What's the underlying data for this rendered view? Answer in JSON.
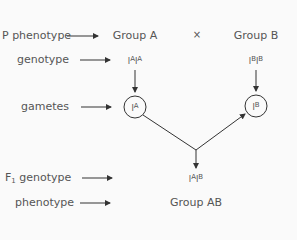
{
  "row_labels": {
    "p_phenotype": "P phenotype",
    "genotype": "genotype",
    "gametes": "gametes",
    "f1_prefix": "F",
    "f1_sub": "1",
    "f1_genotype": " genotype",
    "phenotype": "phenotype"
  },
  "parents": {
    "a": {
      "phenotype": "Group A",
      "allele1_base": "I",
      "allele1_sup": "A",
      "allele2_base": "I",
      "allele2_sup": "A"
    },
    "cross_symbol": "×",
    "b": {
      "phenotype": "Group B",
      "allele1_base": "I",
      "allele1_sup": "B",
      "allele2_base": "I",
      "allele2_sup": "B"
    }
  },
  "gametes": {
    "a": {
      "base": "I",
      "sup": "A"
    },
    "b": {
      "base": "I",
      "sup": "B"
    }
  },
  "offspring": {
    "allele1_base": "I",
    "allele1_sup": "A",
    "allele2_base": "I",
    "allele2_sup": "B",
    "phenotype": "Group AB"
  },
  "colors": {
    "text": "#555555",
    "line": "#333333",
    "background": "#fafafa"
  }
}
